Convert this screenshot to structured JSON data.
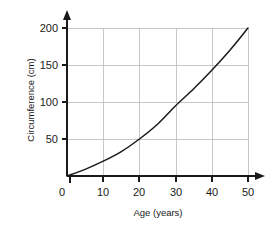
{
  "chart_data": {
    "type": "line",
    "title": "",
    "xlabel": "Age (years)",
    "ylabel": "Circumference (cm)",
    "xlim": [
      0,
      50
    ],
    "ylim": [
      0,
      200
    ],
    "xticks": [
      "0",
      "10",
      "20",
      "30",
      "40",
      "50"
    ],
    "xtick_values": [
      0,
      10,
      20,
      30,
      40,
      50
    ],
    "yticks": [
      "50",
      "100",
      "150",
      "200"
    ],
    "ytick_values": [
      50,
      100,
      150,
      200
    ],
    "grid": true,
    "legend": "none",
    "axis_arrows": true,
    "series": [
      {
        "name": "Circumference vs Age",
        "x": [
          0,
          5,
          10,
          15,
          20,
          25,
          30,
          35,
          40,
          45,
          50
        ],
        "values": [
          0,
          9,
          20,
          33,
          50,
          70,
          95,
          118,
          143,
          170,
          200
        ],
        "color": "#1a1a1a"
      }
    ],
    "colors": {
      "curve": "#1a1a1a",
      "axis": "#1a1a1a",
      "grid": "#b9b9b9",
      "background": "#ffffff"
    }
  },
  "axes": {
    "x_title": "Age (years)",
    "y_title": "Circumference (cm)",
    "x_tick_labels": [
      "0",
      "10",
      "20",
      "30",
      "40",
      "50"
    ],
    "y_tick_labels": [
      "50",
      "100",
      "150",
      "200"
    ]
  }
}
